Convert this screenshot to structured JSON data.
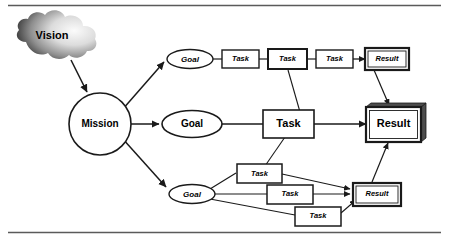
{
  "figure": {
    "background_color": "#ffffff",
    "line_color": "#1a1a1a",
    "rule_color": "#555555"
  },
  "nodes": {
    "vision": {
      "label": "Vision",
      "shape": "cloud",
      "gradient_dark": "#2b2b2b",
      "gradient_light": "#f2f2f2"
    },
    "mission": {
      "label": "Mission",
      "shape": "circle"
    },
    "goal_top": {
      "label": "Goal",
      "shape": "ellipse"
    },
    "goal_mid": {
      "label": "Goal",
      "shape": "ellipse"
    },
    "goal_bottom": {
      "label": "Goal",
      "shape": "ellipse"
    },
    "task_top_1": {
      "label": "Task",
      "shape": "rect"
    },
    "task_top_2": {
      "label": "Task",
      "shape": "rect"
    },
    "task_top_3": {
      "label": "Task",
      "shape": "rect"
    },
    "result_top": {
      "label": "Result",
      "shape": "rect"
    },
    "task_mid": {
      "label": "Task",
      "shape": "rect"
    },
    "result_mid": {
      "label": "Result",
      "shape": "rect-3d"
    },
    "task_bottom_1": {
      "label": "Task",
      "shape": "rect"
    },
    "task_bottom_2": {
      "label": "Task",
      "shape": "rect"
    },
    "task_bottom_3": {
      "label": "Task",
      "shape": "rect"
    },
    "result_bottom": {
      "label": "Result",
      "shape": "rect"
    }
  },
  "edges": [
    {
      "from": "vision",
      "to": "mission",
      "arrow": true
    },
    {
      "from": "mission",
      "to": "goal_top",
      "arrow": true
    },
    {
      "from": "mission",
      "to": "goal_mid",
      "arrow": true
    },
    {
      "from": "mission",
      "to": "goal_bottom",
      "arrow": true
    },
    {
      "from": "goal_top",
      "to": "task_top_1",
      "arrow": false
    },
    {
      "from": "task_top_1",
      "to": "task_top_2",
      "arrow": false
    },
    {
      "from": "task_top_2",
      "to": "task_top_3",
      "arrow": false
    },
    {
      "from": "task_top_3",
      "to": "result_top",
      "arrow": true
    },
    {
      "from": "goal_mid",
      "to": "task_mid",
      "arrow": false
    },
    {
      "from": "task_mid",
      "to": "result_mid",
      "arrow": true
    },
    {
      "from": "result_top",
      "to": "result_mid",
      "arrow": true
    },
    {
      "from": "task_top_2",
      "to": "result_mid",
      "arrow": false
    },
    {
      "from": "task_mid",
      "to": "task_bottom_1",
      "arrow": false
    },
    {
      "from": "result_bottom",
      "to": "result_mid",
      "arrow": true
    },
    {
      "from": "goal_bottom",
      "to": "task_bottom_1",
      "arrow": false
    },
    {
      "from": "goal_bottom",
      "to": "task_bottom_2",
      "arrow": false
    },
    {
      "from": "goal_bottom",
      "to": "task_bottom_3",
      "arrow": false
    },
    {
      "from": "task_bottom_1",
      "to": "result_bottom",
      "arrow": true
    },
    {
      "from": "task_bottom_2",
      "to": "result_bottom",
      "arrow": true
    },
    {
      "from": "task_bottom_3",
      "to": "result_bottom",
      "arrow": true
    }
  ]
}
